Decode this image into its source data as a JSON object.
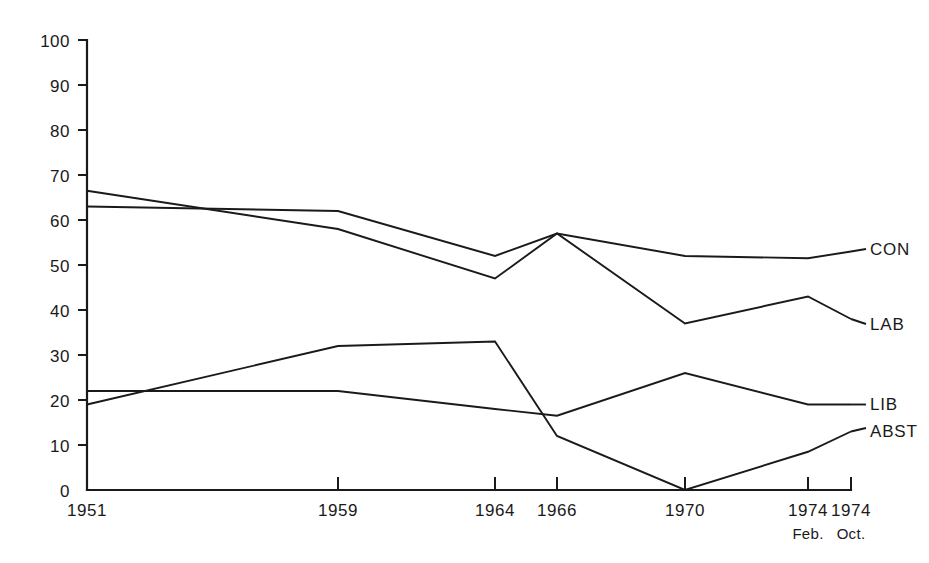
{
  "chart_data": {
    "type": "line",
    "title": "",
    "subtitle": "",
    "xlabel": "",
    "ylabel": "",
    "grid": false,
    "legend_position": "right-inline-labels",
    "ylim": [
      0,
      100
    ],
    "yticks": [
      0,
      10,
      20,
      30,
      40,
      50,
      60,
      70,
      80,
      90,
      100
    ],
    "ytick_labels": [
      "0",
      "10",
      "20",
      "30",
      "40",
      "50",
      "60",
      "70",
      "80",
      "90",
      "100"
    ],
    "categories": [
      "1951",
      "1959",
      "1964",
      "1966",
      "1970",
      "1974",
      "1974"
    ],
    "category_sublabels": [
      "",
      "",
      "",
      "",
      "",
      "Feb.",
      "Oct."
    ],
    "series": [
      {
        "name": "CON",
        "values": [
          63,
          62,
          52,
          57,
          52,
          51.5,
          53
        ]
      },
      {
        "name": "LAB",
        "values": [
          66.5,
          58,
          47,
          57,
          37,
          43,
          38
        ]
      },
      {
        "name": "LIB",
        "values": [
          22,
          22,
          18,
          16.5,
          26,
          19,
          19
        ]
      },
      {
        "name": "ABST",
        "values": [
          19,
          32,
          33,
          12,
          0,
          8.5,
          13
        ]
      }
    ],
    "annotations": []
  },
  "series_labels": {
    "con": "CON",
    "lab": "LAB",
    "lib": "LIB",
    "abst": "ABST"
  },
  "yticks": {
    "t0": "0",
    "t1": "10",
    "t2": "20",
    "t3": "30",
    "t4": "40",
    "t5": "50",
    "t6": "60",
    "t7": "70",
    "t8": "80",
    "t9": "90",
    "t10": "100"
  },
  "xticks": {
    "x0": "1951",
    "x1": "1959",
    "x2": "1964",
    "x3": "1966",
    "x4": "1970",
    "x5": "1974",
    "x6": "1974",
    "x5sub": "Feb.",
    "x6sub": "Oct."
  },
  "colors": {
    "ink": "#1a1a1a",
    "background": "#ffffff"
  }
}
